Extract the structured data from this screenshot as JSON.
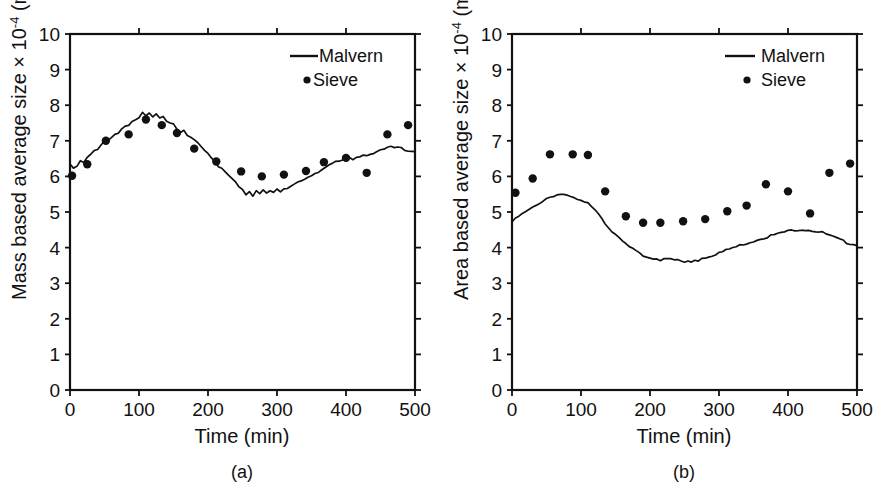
{
  "figure": {
    "background_color": "#ffffff",
    "ink_color": "#111111",
    "width": 884,
    "height": 495
  },
  "chart_data": [
    {
      "type": "line",
      "panel_label": "(a)",
      "title": "",
      "xlabel": "Time (min)",
      "ylabel_prefix": "Mass based average size × 10",
      "ylabel_exponent": "-4",
      "ylabel_units_open": " (m",
      "ylabel_units_sup1": "4",
      "ylabel_units_mid": " m",
      "ylabel_units_sup2": "-3",
      "ylabel_units_close": ")",
      "ylabel_full": "Mass based average size × 10-4 (m4 m-3)",
      "xlim": [
        0,
        500
      ],
      "ylim": [
        0,
        10
      ],
      "xticks": [
        0,
        100,
        200,
        300,
        400,
        500
      ],
      "yticks": [
        0,
        1,
        2,
        3,
        4,
        5,
        6,
        7,
        8,
        9,
        10
      ],
      "grid": false,
      "legend_position": "top-right",
      "series": [
        {
          "name": "Malvern",
          "style": "line",
          "x": [
            0,
            5,
            10,
            15,
            20,
            25,
            30,
            35,
            40,
            45,
            50,
            55,
            60,
            65,
            70,
            75,
            80,
            85,
            90,
            95,
            100,
            105,
            110,
            115,
            120,
            125,
            130,
            135,
            140,
            145,
            150,
            155,
            160,
            165,
            170,
            175,
            180,
            185,
            190,
            195,
            200,
            205,
            210,
            215,
            220,
            225,
            230,
            235,
            240,
            245,
            250,
            255,
            260,
            265,
            270,
            275,
            280,
            285,
            290,
            295,
            300,
            305,
            310,
            315,
            320,
            325,
            330,
            335,
            340,
            345,
            350,
            355,
            360,
            365,
            370,
            375,
            380,
            385,
            390,
            395,
            400,
            405,
            410,
            415,
            420,
            425,
            430,
            435,
            440,
            445,
            450,
            455,
            460,
            465,
            470,
            475,
            480,
            485,
            490,
            495,
            500
          ],
          "y": [
            6.35,
            6.2,
            6.28,
            6.42,
            6.38,
            6.52,
            6.6,
            6.72,
            6.78,
            6.9,
            7.0,
            7.02,
            7.12,
            7.18,
            7.22,
            7.32,
            7.38,
            7.42,
            7.52,
            7.58,
            7.62,
            7.78,
            7.68,
            7.8,
            7.7,
            7.78,
            7.66,
            7.72,
            7.58,
            7.52,
            7.44,
            7.3,
            7.22,
            7.28,
            7.14,
            7.08,
            7.0,
            6.92,
            6.86,
            6.74,
            6.66,
            6.52,
            6.44,
            6.3,
            6.24,
            6.1,
            6.02,
            5.92,
            5.84,
            5.7,
            5.62,
            5.48,
            5.58,
            5.46,
            5.62,
            5.52,
            5.64,
            5.56,
            5.62,
            5.58,
            5.64,
            5.56,
            5.62,
            5.66,
            5.72,
            5.78,
            5.82,
            5.9,
            5.94,
            6.0,
            6.04,
            6.1,
            6.14,
            6.22,
            6.28,
            6.3,
            6.36,
            6.4,
            6.42,
            6.46,
            6.48,
            6.52,
            6.5,
            6.56,
            6.58,
            6.62,
            6.6,
            6.64,
            6.66,
            6.7,
            6.72,
            6.76,
            6.8,
            6.82,
            6.78,
            6.8,
            6.78,
            6.76,
            6.74,
            6.72,
            6.72
          ]
        },
        {
          "name": "Sieve",
          "style": "markers",
          "x": [
            3,
            25,
            52,
            85,
            110,
            133,
            155,
            180,
            212,
            248,
            278,
            310,
            342,
            368,
            400,
            430,
            460,
            490
          ],
          "y": [
            6.02,
            6.34,
            7.0,
            7.18,
            7.6,
            7.44,
            7.22,
            6.78,
            6.42,
            6.14,
            6.0,
            6.05,
            6.15,
            6.4,
            6.52,
            6.1,
            7.18,
            7.44
          ]
        }
      ]
    },
    {
      "type": "line",
      "panel_label": "(b)",
      "title": "",
      "xlabel": "Time (min)",
      "ylabel_prefix": "Area based average size × 10",
      "ylabel_exponent": "-4",
      "ylabel_units_open": " (m",
      "ylabel_units_sup1": "3",
      "ylabel_units_mid": " m",
      "ylabel_units_sup2": "-2",
      "ylabel_units_close": ")",
      "ylabel_full": "Area based average size × 10-4 (m3 m-2)",
      "xlim": [
        0,
        500
      ],
      "ylim": [
        0,
        10
      ],
      "xticks": [
        0,
        100,
        200,
        300,
        400,
        500
      ],
      "yticks": [
        0,
        1,
        2,
        3,
        4,
        5,
        6,
        7,
        8,
        9,
        10
      ],
      "grid": false,
      "legend_position": "top-right",
      "series": [
        {
          "name": "Malvern",
          "style": "line",
          "x": [
            0,
            5,
            10,
            15,
            20,
            25,
            30,
            35,
            40,
            45,
            50,
            55,
            60,
            65,
            70,
            75,
            80,
            85,
            90,
            95,
            100,
            105,
            110,
            115,
            120,
            125,
            130,
            135,
            140,
            145,
            150,
            155,
            160,
            165,
            170,
            175,
            180,
            185,
            190,
            195,
            200,
            205,
            210,
            215,
            220,
            225,
            230,
            235,
            240,
            245,
            250,
            255,
            260,
            265,
            270,
            275,
            280,
            285,
            290,
            295,
            300,
            305,
            310,
            315,
            320,
            325,
            330,
            335,
            340,
            345,
            350,
            355,
            360,
            365,
            370,
            375,
            380,
            385,
            390,
            395,
            400,
            405,
            410,
            415,
            420,
            425,
            430,
            435,
            440,
            445,
            450,
            455,
            460,
            465,
            470,
            475,
            480,
            485,
            490,
            495,
            500
          ],
          "y": [
            4.72,
            4.8,
            4.88,
            4.94,
            5.0,
            5.06,
            5.12,
            5.18,
            5.26,
            5.32,
            5.38,
            5.42,
            5.46,
            5.48,
            5.5,
            5.48,
            5.44,
            5.42,
            5.38,
            5.34,
            5.3,
            5.26,
            5.24,
            5.18,
            5.1,
            4.98,
            4.84,
            4.7,
            4.58,
            4.46,
            4.34,
            4.26,
            4.18,
            4.1,
            4.02,
            3.96,
            3.88,
            3.82,
            3.78,
            3.74,
            3.72,
            3.68,
            3.7,
            3.66,
            3.7,
            3.66,
            3.68,
            3.64,
            3.66,
            3.62,
            3.58,
            3.62,
            3.6,
            3.66,
            3.64,
            3.7,
            3.72,
            3.76,
            3.78,
            3.82,
            3.86,
            3.88,
            3.92,
            3.96,
            4.0,
            4.02,
            4.06,
            4.1,
            4.12,
            4.16,
            4.18,
            4.22,
            4.26,
            4.28,
            4.3,
            4.34,
            4.36,
            4.38,
            4.42,
            4.44,
            4.46,
            4.48,
            4.5,
            4.5,
            4.52,
            4.5,
            4.5,
            4.48,
            4.46,
            4.44,
            4.42,
            4.38,
            4.34,
            4.3,
            4.26,
            4.22,
            4.18,
            4.14,
            4.12,
            4.1,
            4.08
          ]
        },
        {
          "name": "Sieve",
          "style": "markers",
          "x": [
            5,
            30,
            55,
            88,
            110,
            135,
            165,
            190,
            215,
            248,
            280,
            312,
            340,
            368,
            400,
            432,
            460,
            490
          ],
          "y": [
            5.54,
            5.94,
            6.62,
            6.62,
            6.6,
            5.58,
            4.88,
            4.7,
            4.7,
            4.74,
            4.8,
            5.02,
            5.18,
            5.78,
            5.58,
            4.96,
            6.1,
            6.36
          ]
        }
      ]
    }
  ],
  "legend": {
    "malvern_label": "Malvern",
    "sieve_label": "Sieve"
  },
  "captions": {
    "panel_a": "(a)",
    "panel_b": "(b)"
  },
  "axis_symbols": {
    "times_sign": "×",
    "minus": "−"
  }
}
